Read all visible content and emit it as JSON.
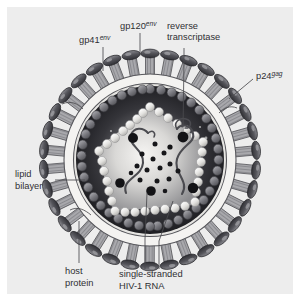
{
  "figure": {
    "background_color": "#ededed",
    "page_background": "#ffffff",
    "text_color": "#2f2f33"
  },
  "labels": {
    "gp120": {
      "base": "gp120",
      "sup": "env",
      "lines": [
        "gp120env"
      ]
    },
    "gp41": {
      "base": "gp41",
      "sup": "env"
    },
    "p24": {
      "base": "p24",
      "sup": "gag"
    },
    "reverse_transcriptase": {
      "line1": "reverse",
      "line2": "transcriptase"
    },
    "lipid_bilayer": {
      "line1": "lipid",
      "line2": "bilayer"
    },
    "host_protein": {
      "line1": "host",
      "line2": "protein"
    },
    "rna": {
      "line1": "single-stranded",
      "line2": "HIV-1 RNA"
    }
  },
  "structure": {
    "center": {
      "x": 143,
      "y": 153
    },
    "spike_count": 34,
    "spike_radius": 104,
    "bilayer_outer_radius": 86,
    "bilayer_inner_radius": 76,
    "capsid_bead_radius": 70,
    "capsid_bead_count": 40,
    "matrix_radius": 66,
    "core_bead_count": 34,
    "rt_enzyme_count": 6,
    "rna_strand_count": 2,
    "colors": {
      "spike_cap": "#4f4f55",
      "spike_stem": "#9a9a9e",
      "bilayer": "#f2f1ef",
      "capsid_bead": "#77777d",
      "matrix_dark": "#2a2a2e",
      "core_light": "#f0efed",
      "rna_strand": "#4b4b50",
      "enzyme": "#121214"
    }
  }
}
